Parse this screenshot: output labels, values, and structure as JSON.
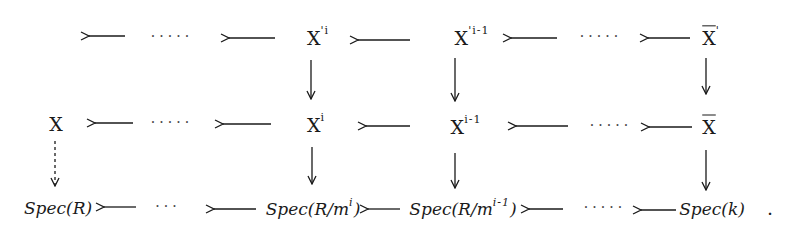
{
  "diagram": {
    "type": "commutative-diagram",
    "style": "handwritten",
    "colors": {
      "ink": "#1a1a1a",
      "background": "#ffffff"
    },
    "rows": [
      {
        "name": "top-row",
        "nodes": [
          {
            "id": "xpi",
            "base": "X",
            "sup": "'i",
            "overline": false
          },
          {
            "id": "xpim1",
            "base": "X",
            "sup": "'i-1",
            "overline": false
          },
          {
            "id": "xbarp",
            "base": "X",
            "sup": "'",
            "overline": true
          }
        ]
      },
      {
        "name": "middle-row",
        "nodes": [
          {
            "id": "x",
            "base": "X",
            "sup": "",
            "overline": false
          },
          {
            "id": "xi",
            "base": "X",
            "sup": "i",
            "overline": false
          },
          {
            "id": "xim1",
            "base": "X",
            "sup": "i-1",
            "overline": false
          },
          {
            "id": "xbar",
            "base": "X",
            "sup": "",
            "overline": true
          }
        ]
      },
      {
        "name": "bottom-row",
        "nodes": [
          {
            "id": "specR",
            "label": "Spec(R)"
          },
          {
            "id": "specRmi",
            "label": "Spec(R/m",
            "sup": "i",
            "close": ")"
          },
          {
            "id": "specRmim1",
            "label": "Spec(R/m",
            "sup": "i-1",
            "close": ")"
          },
          {
            "id": "speck",
            "label": "Spec(k)"
          }
        ]
      }
    ],
    "ellipsis": "·····",
    "ellipsis_short": "···",
    "trailing_punctuation": ".",
    "arrows": [
      {
        "from": "dots-top-left",
        "to": "left-edge",
        "direction": "left"
      },
      {
        "from": "xpi",
        "to": "dots-top-left",
        "direction": "left"
      },
      {
        "from": "xpim1",
        "to": "xpi",
        "direction": "left"
      },
      {
        "from": "dots-top-right",
        "to": "xpim1",
        "direction": "left"
      },
      {
        "from": "xbarp",
        "to": "dots-top-right",
        "direction": "left"
      },
      {
        "from": "xpi",
        "to": "xi",
        "direction": "down"
      },
      {
        "from": "xpim1",
        "to": "xim1",
        "direction": "down"
      },
      {
        "from": "xbarp",
        "to": "xbar",
        "direction": "down"
      },
      {
        "from": "dots-mid-left",
        "to": "x",
        "direction": "left"
      },
      {
        "from": "xi",
        "to": "dots-mid-left",
        "direction": "left"
      },
      {
        "from": "xim1",
        "to": "xi",
        "direction": "left"
      },
      {
        "from": "dots-mid-right",
        "to": "xim1",
        "direction": "left"
      },
      {
        "from": "xbar",
        "to": "dots-mid-right",
        "direction": "left"
      },
      {
        "from": "x",
        "to": "specR",
        "direction": "down",
        "dashed": true
      },
      {
        "from": "xi",
        "to": "specRmi",
        "direction": "down"
      },
      {
        "from": "xim1",
        "to": "specRmim1",
        "direction": "down"
      },
      {
        "from": "xbar",
        "to": "speck",
        "direction": "down"
      },
      {
        "from": "dots-bot-left",
        "to": "specR",
        "direction": "left"
      },
      {
        "from": "specRmi",
        "to": "dots-bot-left",
        "direction": "left"
      },
      {
        "from": "specRmim1",
        "to": "specRmi",
        "direction": "left"
      },
      {
        "from": "dots-bot-right",
        "to": "specRmim1",
        "direction": "left"
      },
      {
        "from": "speck",
        "to": "dots-bot-right",
        "direction": "left"
      }
    ]
  }
}
